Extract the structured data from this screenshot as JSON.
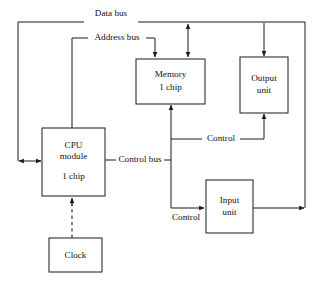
{
  "diagram": {
    "nodes": [
      {
        "id": "cpu",
        "lines": [
          "CPU",
          "module",
          "1 chip"
        ]
      },
      {
        "id": "memory",
        "lines": [
          "Memory",
          "1 chip"
        ]
      },
      {
        "id": "output",
        "lines": [
          "Output",
          "unit"
        ]
      },
      {
        "id": "input",
        "lines": [
          "Input",
          "unit"
        ]
      },
      {
        "id": "clock",
        "lines": [
          "Clock"
        ]
      }
    ],
    "node_labels": {
      "cpu_line1": "CPU",
      "cpu_line2": "module",
      "cpu_line3": "1 chip",
      "memory_line1": "Memory",
      "memory_line2": "1 chip",
      "output_line1": "Output",
      "output_line2": "unit",
      "input_line1": "Input",
      "input_line2": "unit",
      "clock_line1": "Clock"
    },
    "bus_labels": {
      "data_bus": "Data bus",
      "address_bus": "Address bus",
      "control_bus": "Control bus",
      "control_output": "Control",
      "control_input": "Control"
    },
    "colors": {
      "line": "#1a1a1a",
      "text": "#111111",
      "background": "#ffffff"
    }
  }
}
